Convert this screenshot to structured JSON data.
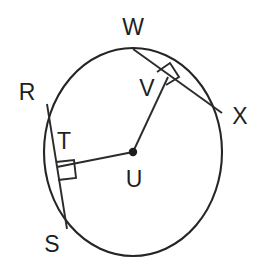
{
  "figure": {
    "type": "geometry-diagram",
    "background_color": "#ffffff",
    "stroke_color": "#252525",
    "label_color": "#1f1f1f"
  },
  "labels": {
    "w": "W",
    "v": "V",
    "x": "X",
    "r": "R",
    "t": "T",
    "u": "U",
    "s": "S"
  },
  "geometry": {
    "circle": {
      "cx": 133,
      "cy": 152,
      "r": 103
    },
    "points": {
      "U": {
        "x": 133,
        "y": 152,
        "role": "center"
      },
      "W": {
        "x": 133,
        "y": 49,
        "role": "on-circle"
      },
      "X": {
        "x": 222,
        "y": 113,
        "role": "on-circle"
      },
      "V": {
        "x": 167,
        "y": 78,
        "role": "foot-of-perpendicular"
      },
      "R": {
        "x": 48,
        "y": 105,
        "role": "on-circle"
      },
      "S": {
        "x": 67,
        "y": 229,
        "role": "on-circle"
      },
      "T": {
        "x": 56,
        "y": 167,
        "role": "foot-of-perpendicular"
      }
    },
    "segments": [
      {
        "name": "chord-WX",
        "from": "W",
        "to": "X"
      },
      {
        "name": "chord-RS",
        "from": "R",
        "to": "S"
      },
      {
        "name": "radius-UV",
        "from": "U",
        "to": "V"
      },
      {
        "name": "radius-UT",
        "from": "U",
        "to": "T"
      }
    ],
    "right_angles": [
      {
        "name": "right-angle-at-V",
        "vertex": "V",
        "size": 14
      },
      {
        "name": "right-angle-at-T",
        "vertex": "T",
        "size": 16
      }
    ]
  },
  "label_positions": {
    "w": {
      "x": 133,
      "y": 35
    },
    "v": {
      "x": 147,
      "y": 96
    },
    "x": {
      "x": 240,
      "y": 124
    },
    "r": {
      "x": 27,
      "y": 100
    },
    "t": {
      "x": 64,
      "y": 149
    },
    "u": {
      "x": 134,
      "y": 187
    },
    "s": {
      "x": 52,
      "y": 252
    }
  }
}
